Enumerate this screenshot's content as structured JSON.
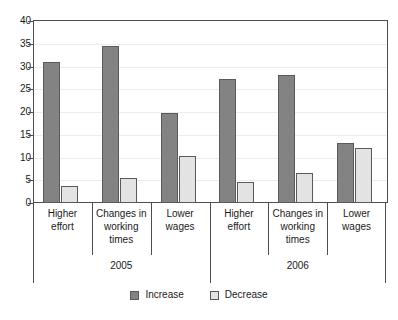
{
  "chart_data": {
    "type": "bar",
    "title": "",
    "subtitle": "",
    "xlabel": "",
    "ylabel": "",
    "ylim": [
      0,
      40
    ],
    "yticks": [
      0,
      5,
      10,
      15,
      20,
      25,
      30,
      35,
      40
    ],
    "ytick_labels": [
      "0",
      "5",
      "10",
      "15",
      "20",
      "25",
      "30",
      "35",
      "40"
    ],
    "grid": true,
    "legend_position": "bottom-center",
    "group_labels": [
      "2005",
      "2006"
    ],
    "categories": [
      "Higher effort",
      "Changes in working times",
      "Lower wages",
      "Higher effort",
      "Changes in working times",
      "Lower wages"
    ],
    "category_lines": [
      [
        "Higher",
        "effort"
      ],
      [
        "Changes in",
        "working",
        "times"
      ],
      [
        "Lower",
        "wages"
      ],
      [
        "Higher",
        "effort"
      ],
      [
        "Changes in",
        "working",
        "times"
      ],
      [
        "Lower",
        "wages"
      ]
    ],
    "series": [
      {
        "name": "Increase",
        "color": "#838383",
        "values": [
          31.1,
          34.5,
          19.7,
          27.2,
          28.2,
          13.2
        ]
      },
      {
        "name": "Decrease",
        "color": "#e3e3e3",
        "values": [
          3.8,
          5.6,
          10.3,
          4.7,
          6.7,
          12.2
        ]
      }
    ],
    "grouped_values": {
      "2005": {
        "Higher effort": {
          "Increase": 31.1,
          "Decrease": 3.8
        },
        "Changes in working times": {
          "Increase": 34.5,
          "Decrease": 5.6
        },
        "Lower wages": {
          "Increase": 19.7,
          "Decrease": 10.3
        }
      },
      "2006": {
        "Higher effort": {
          "Increase": 27.2,
          "Decrease": 4.7
        },
        "Changes in working times": {
          "Increase": 28.2,
          "Decrease": 6.7
        },
        "Lower wages": {
          "Increase": 13.2,
          "Decrease": 12.2
        }
      }
    },
    "legend": [
      {
        "label": "Increase",
        "color": "#838383"
      },
      {
        "label": "Decrease",
        "color": "#e3e3e3"
      }
    ],
    "colors": {
      "increase": "#838383",
      "decrease": "#e3e3e3",
      "axis": "#4d4d4d",
      "grid": "#ececec",
      "text": "#1a1a1a",
      "background": "#ffffff"
    }
  }
}
